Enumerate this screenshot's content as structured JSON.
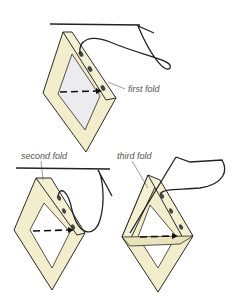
{
  "diagram": {
    "labels": {
      "first_fold": "first fold",
      "second_fold": "second fold",
      "third_fold": "third fold"
    },
    "colors": {
      "frame_fill": "#f2eecb",
      "frame_shadow": "#ddd8a8",
      "inner_fill": "#e8e8ec",
      "outline": "#2a2a2a",
      "label_text": "#555555"
    }
  }
}
